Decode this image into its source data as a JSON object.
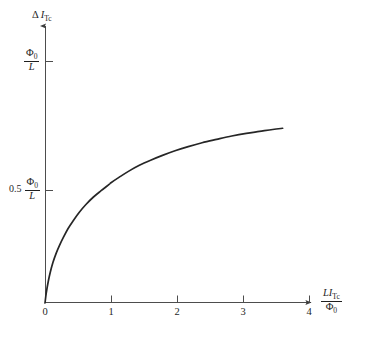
{
  "chart_data": {
    "type": "line",
    "title": "",
    "subtitle": "",
    "ylabel_parts": {
      "delta": "Δ",
      "symbol": "I",
      "subscript": "Tc"
    },
    "xlabel_parts": {
      "numerator_prefix": "L",
      "numerator_symbol": "I",
      "numerator_subscript": "Tc",
      "denominator": "Φ",
      "denominator_subscript": "0"
    },
    "x_tick_labels": [
      "0",
      "1",
      "2",
      "3",
      "4"
    ],
    "x_tick_values": [
      0,
      1,
      2,
      3,
      4
    ],
    "y_tick_labels": [
      "Φ₀/L",
      "0.5 Φ₀/L"
    ],
    "y_tick_values": [
      1.0,
      0.5
    ],
    "y_tick_parts": [
      {
        "scalar": "",
        "numerator": "Φ",
        "numerator_sub": "0",
        "denominator": "L"
      },
      {
        "scalar": "0.5",
        "numerator": "Φ",
        "numerator_sub": "0",
        "denominator": "L"
      }
    ],
    "xlim": [
      0,
      4.35
    ],
    "ylim": [
      0,
      1.18
    ],
    "grid": false,
    "legend": null,
    "axis_arrows": true,
    "series": [
      {
        "name": "saturating response",
        "x": [
          0.0,
          0.02,
          0.05,
          0.08,
          0.12,
          0.17,
          0.22,
          0.28,
          0.35,
          0.43,
          0.52,
          0.62,
          0.73,
          0.85,
          0.98,
          1.0,
          1.12,
          1.27,
          1.43,
          1.6,
          1.78,
          1.97,
          2.17,
          2.38,
          2.6,
          2.83,
          3.05,
          3.25,
          3.45,
          3.6
        ],
        "y": [
          0.0,
          0.043,
          0.09,
          0.127,
          0.167,
          0.206,
          0.238,
          0.272,
          0.308,
          0.341,
          0.375,
          0.407,
          0.437,
          0.464,
          0.492,
          0.497,
          0.519,
          0.545,
          0.569,
          0.59,
          0.61,
          0.629,
          0.646,
          0.662,
          0.676,
          0.69,
          0.701,
          0.709,
          0.717,
          0.722
        ]
      }
    ],
    "curve_color": "#262626",
    "axis_color": "#4d4d4d",
    "curve_endpoint": {
      "x": 3.6,
      "y": 0.722
    }
  }
}
